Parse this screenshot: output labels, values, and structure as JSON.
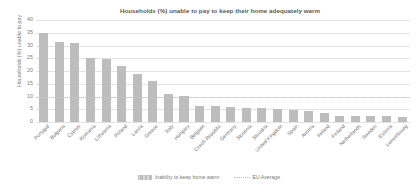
{
  "chart_data": {
    "type": "bar",
    "title": "Households (%) unable to pay to keep their home adequately warm",
    "xlabel": "",
    "ylabel": "Households (%) unable to pay",
    "ylim": [
      0,
      40
    ],
    "yticks": [
      0,
      5,
      10,
      15,
      20,
      25,
      30,
      35,
      40
    ],
    "grid": true,
    "legend_position": "bottom",
    "categories": [
      "Portugal",
      "Bulgaria",
      "Cyprus",
      "Romania",
      "Lithuania",
      "Poland",
      "Latvia",
      "Greece",
      "Italy",
      "Hungary",
      "Belgium",
      "Czech Republic",
      "Germany",
      "Slovenia",
      "Slovakia",
      "United Kingdom",
      "Spain",
      "Austria",
      "Ireland",
      "Finland",
      "Netherlands",
      "Sweden",
      "Estonia",
      "Luxembourg"
    ],
    "series": [
      {
        "name": "Inability to keep home warm",
        "color": "#bdbdbd",
        "values": [
          35.0,
          31.5,
          30.8,
          25.2,
          24.7,
          22.0,
          19.0,
          16.0,
          10.8,
          10.2,
          6.2,
          6.1,
          5.8,
          5.6,
          5.4,
          5.3,
          4.9,
          4.4,
          3.5,
          2.5,
          2.4,
          2.3,
          2.2,
          1.8
        ]
      }
    ],
    "reference_line": {
      "name": "EU Average",
      "value": 10.0,
      "style": "dotted",
      "color": "#c4c4c6"
    }
  },
  "legend": {
    "entries": [
      {
        "label": "Inability to keep home warm",
        "marker": "bar-swatch"
      },
      {
        "label": "EU Average",
        "marker": "dotted-line"
      }
    ]
  }
}
